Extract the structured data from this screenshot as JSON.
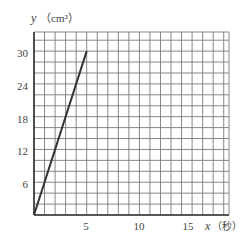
{
  "chart_data": {
    "type": "line",
    "title": "",
    "xlabel": "x（秒）",
    "ylabel": "y（cm²）",
    "x_ticks": [
      5,
      10,
      15
    ],
    "y_ticks": [
      6,
      12,
      18,
      24,
      30
    ],
    "xlim": [
      0,
      18.5
    ],
    "ylim": [
      0,
      33.5
    ],
    "grid": true,
    "grid_step": {
      "x": 1,
      "y": 2
    },
    "series": [
      {
        "name": "y",
        "points": [
          [
            0,
            0
          ],
          [
            5,
            30
          ]
        ]
      }
    ]
  },
  "labels": {
    "y_axis_var": "y",
    "y_axis_unit": "（cm²）",
    "x_axis_var": "x",
    "x_axis_unit": "（秒）",
    "x_tick_5": "5",
    "x_tick_10": "10",
    "x_tick_15": "15",
    "y_tick_6": "6",
    "y_tick_12": "12",
    "y_tick_18": "18",
    "y_tick_24": "24",
    "y_tick_30": "30"
  },
  "colors": {
    "grid": "#7a7a7a",
    "axis": "#333333",
    "line": "#333333"
  }
}
